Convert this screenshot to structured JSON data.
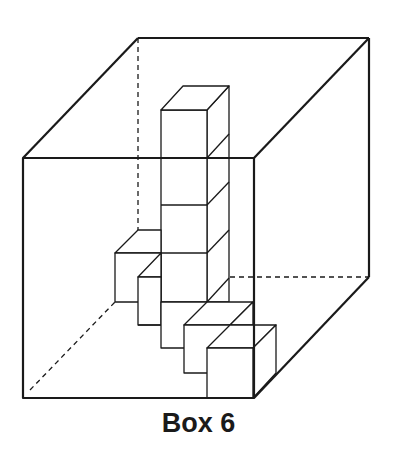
{
  "figure": {
    "caption": "Box 6",
    "colors": {
      "line": "#1a1a1a",
      "background": "#ffffff"
    }
  }
}
